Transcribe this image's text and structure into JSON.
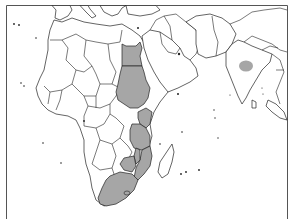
{
  "map": {
    "title": "",
    "colors": {
      "background": "#ffffff",
      "land": "#ffffff",
      "shaded": "#a6a6a6",
      "outline": "#222222",
      "frame": "#555555"
    },
    "frame": {
      "top_y": 5,
      "left_x": 6,
      "right_x": 287
    },
    "shaded_regions": [
      "Egypt",
      "Sudan",
      "Kenya",
      "Tanzania",
      "Malawi",
      "Mozambique",
      "Zimbabwe",
      "South Africa",
      "Lesotho",
      "Central India (region)"
    ],
    "legend": null
  }
}
